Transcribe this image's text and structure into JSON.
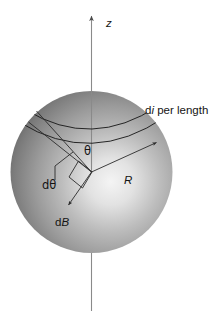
{
  "figure": {
    "title_visible": false,
    "background_color": "#ffffff",
    "width": 224,
    "height": 326
  },
  "sphere": {
    "center_x": 91.5,
    "center_y": 172,
    "radius": 81,
    "highlight_color": "#f2f2f2",
    "mid_color": "#9a9a9a",
    "edge_color": "#4a4a4a",
    "highlight_offset_x": 0.62,
    "highlight_offset_y": 0.56
  },
  "axis": {
    "name": "z-axis",
    "label": "z",
    "label_x": 106,
    "label_y": 26,
    "top_y": 16,
    "bottom_y": 311,
    "x": 91.5,
    "color": "#8a8a8a",
    "arrow_at_top": true
  },
  "labels": {
    "current_prefix": "d",
    "current_symbol": "i",
    "current_suffix": " per length",
    "current_x": 145,
    "current_y": 113,
    "theta": "θ",
    "theta_x": 88,
    "theta_y": 152,
    "dtheta_prefix": "d",
    "dtheta_symbol": "θ",
    "dtheta_x": 44,
    "dtheta_y": 185,
    "radius_label": "R",
    "radius_x": 126,
    "radius_y": 180,
    "dB_prefix": "d",
    "dB_symbol": "B",
    "dB_x": 57,
    "dB_y": 223
  },
  "bands": {
    "description": "current ring band on sphere surface",
    "upper_arc": "M 31.5 113 Q 92 147 152.5 110",
    "lower_arc": "M 24 124 Q 92 163 160 120",
    "color": "#1d1d1d"
  },
  "rays": {
    "theta_upper": {
      "x1": 91.5,
      "y1": 172,
      "x2": 38,
      "y2": 112
    },
    "theta_lower": {
      "x1": 91.5,
      "y1": 172,
      "x2": 30,
      "y2": 122
    },
    "radius_ray": {
      "x1": 91.5,
      "y1": 172,
      "x2": 157,
      "y2": 142
    },
    "dB_ray": {
      "x1": 91.5,
      "y1": 172,
      "x2": 68,
      "y2": 205
    },
    "dtheta_leader": [
      {
        "x1": 57,
        "y1": 176,
        "x2": 57,
        "y2": 166
      },
      {
        "x1": 57,
        "y1": 166,
        "x2": 72,
        "y2": 153
      }
    ],
    "color": "#2b2b2b"
  },
  "right_angle_marker": {
    "name": "right-angle-square",
    "points": "78,162 92,172 83,187 69,176"
  }
}
